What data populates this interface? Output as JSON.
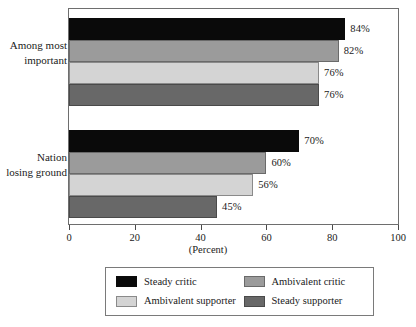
{
  "chart_data": {
    "type": "bar",
    "orientation": "horizontal",
    "title": "",
    "xlabel": "(Percent)",
    "ylabel": "",
    "xlim": [
      0,
      100
    ],
    "xticks": [
      "0",
      "20",
      "40",
      "60",
      "80",
      "100"
    ],
    "grid": false,
    "legend_position": "bottom",
    "categories": [
      "Among most important",
      "Nation losing ground"
    ],
    "category_lines": [
      [
        "Among most",
        "important"
      ],
      [
        "Nation",
        "losing ground"
      ]
    ],
    "series": [
      {
        "name": "Steady critic",
        "color": "#0a0a0a",
        "values": [
          84,
          70
        ],
        "labels": [
          "84%",
          "70%"
        ]
      },
      {
        "name": "Ambivalent critic",
        "color": "#9b9b9b",
        "values": [
          82,
          60
        ],
        "labels": [
          "82%",
          "60%"
        ]
      },
      {
        "name": "Ambivalent supporter",
        "color": "#d4d4d4",
        "values": [
          76,
          56
        ],
        "labels": [
          "76%",
          "56%"
        ]
      },
      {
        "name": "Steady supporter",
        "color": "#686868",
        "values": [
          76,
          45
        ],
        "labels": [
          "76%",
          "45%"
        ]
      }
    ],
    "legend_order": [
      {
        "name": "Steady critic",
        "color": "#0a0a0a",
        "swatch": "s0"
      },
      {
        "name": "Ambivalent critic",
        "color": "#9b9b9b",
        "swatch": "s1"
      },
      {
        "name": "Ambivalent supporter",
        "color": "#d4d4d4",
        "swatch": "s2"
      },
      {
        "name": "Steady supporter",
        "color": "#686868",
        "swatch": "s3"
      }
    ]
  },
  "axis": {
    "x_title": "(Percent)",
    "ticks": [
      {
        "label": "0",
        "value": 0
      },
      {
        "label": "20",
        "value": 20
      },
      {
        "label": "40",
        "value": 40
      },
      {
        "label": "60",
        "value": 60
      },
      {
        "label": "80",
        "value": 80
      },
      {
        "label": "100",
        "value": 100
      }
    ]
  },
  "groups": [
    {
      "line1": "Among most",
      "line2": "important",
      "bars": [
        {
          "series": "Steady critic",
          "value": 84,
          "label": "84%",
          "swatch": "s0"
        },
        {
          "series": "Ambivalent critic",
          "value": 82,
          "label": "82%",
          "swatch": "s1"
        },
        {
          "series": "Ambivalent supporter",
          "value": 76,
          "label": "76%",
          "swatch": "s2"
        },
        {
          "series": "Steady supporter",
          "value": 76,
          "label": "76%",
          "swatch": "s3"
        }
      ]
    },
    {
      "line1": "Nation",
      "line2": "losing ground",
      "bars": [
        {
          "series": "Steady critic",
          "value": 70,
          "label": "70%",
          "swatch": "s0"
        },
        {
          "series": "Ambivalent critic",
          "value": 60,
          "label": "60%",
          "swatch": "s1"
        },
        {
          "series": "Ambivalent supporter",
          "value": 56,
          "label": "56%",
          "swatch": "s2"
        },
        {
          "series": "Steady supporter",
          "value": 45,
          "label": "45%",
          "swatch": "s3"
        }
      ]
    }
  ],
  "legend": {
    "items": [
      {
        "label": "Steady critic",
        "swatch": "s0"
      },
      {
        "label": "Ambivalent critic",
        "swatch": "s1"
      },
      {
        "label": "Ambivalent supporter",
        "swatch": "s2"
      },
      {
        "label": "Steady supporter",
        "swatch": "s3"
      }
    ]
  },
  "colors": {
    "steady_critic": "#0a0a0a",
    "ambivalent_critic": "#9b9b9b",
    "ambivalent_supporter": "#d4d4d4",
    "steady_supporter": "#686868",
    "frame": "#6e6e6e",
    "text": "#1a1a1a"
  }
}
